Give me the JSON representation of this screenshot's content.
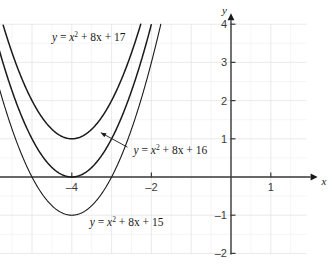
{
  "chart_data": {
    "type": "line",
    "title": "",
    "xlabel": "x",
    "ylabel": "y",
    "xlim": [
      -6.0,
      1.9
    ],
    "ylim": [
      -2.0,
      4.0
    ],
    "grid": true,
    "grid_minor_step": 0.5,
    "grid_major_step": 1.0,
    "legend_position": "inline-annotations",
    "axis_style": "arrowed-cartesian",
    "x_ticks": [
      -6,
      -4,
      -2,
      1
    ],
    "x_tick_labels": [
      "–6",
      "–4",
      "–2",
      "1"
    ],
    "y_ticks": [
      4,
      3,
      2,
      1,
      -1,
      -2
    ],
    "y_tick_labels": [
      "4",
      "3",
      "2",
      "1",
      "–1",
      "–2"
    ],
    "series": [
      {
        "name": "y = x² + 8x + 17",
        "equation_coefficients": {
          "a": 1,
          "b": 8,
          "c": 17
        },
        "vertex": [
          -4,
          1
        ],
        "roots": [],
        "y_intercept": 17,
        "label_text_parts": {
          "lhs": "y",
          "eq": " = ",
          "x": "x",
          "exponent": "2",
          "rest": " + 8x + 17"
        },
        "label_position": [
          -4.5,
          3.55
        ],
        "has_pointer": false,
        "stroke": "#1a1a1a",
        "stroke_width": 1.5
      },
      {
        "name": "y = x² + 8x + 16",
        "equation_coefficients": {
          "a": 1,
          "b": 8,
          "c": 16
        },
        "vertex": [
          -4,
          0
        ],
        "roots": [
          -4
        ],
        "y_intercept": 16,
        "label_text_parts": {
          "lhs": "y",
          "eq": " = ",
          "x": "x",
          "exponent": "2",
          "rest": " + 8x + 16"
        },
        "label_position": [
          -2.45,
          0.6
        ],
        "has_pointer": true,
        "pointer_from": [
          -2.6,
          0.78
        ],
        "pointer_to": [
          -3.27,
          1.16
        ],
        "stroke": "#1a1a1a",
        "stroke_width": 1.5
      },
      {
        "name": "y = x² + 8x + 15",
        "equation_coefficients": {
          "a": 1,
          "b": 8,
          "c": 15
        },
        "vertex": [
          -4,
          -1
        ],
        "roots": [
          -5,
          -3
        ],
        "y_intercept": 15,
        "label_text_parts": {
          "lhs": "y",
          "eq": " = ",
          "x": "x",
          "exponent": "2",
          "rest": " + 8x + 15"
        },
        "label_position": [
          -3.55,
          -1.27
        ],
        "has_pointer": false,
        "stroke": "#1a1a1a",
        "stroke_width": 1.1
      }
    ],
    "colors": {
      "background": "#ffffff",
      "axis": "#3a3a3a",
      "grid_minor": "#f0eef0",
      "grid_major": "#e6e2e6",
      "curve": "#1a1a1a",
      "text": "#1a1a1a",
      "tick_text": "#3a3a3a"
    }
  }
}
